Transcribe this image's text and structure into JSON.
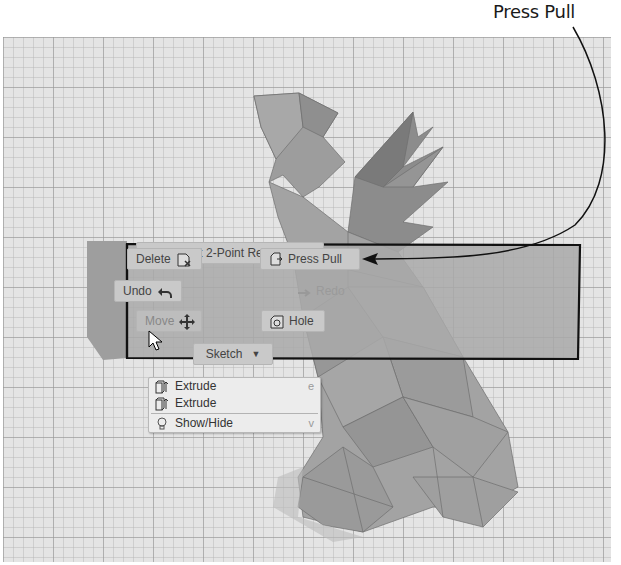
{
  "annotation": {
    "label": "Press Pull"
  },
  "marking_menu": {
    "repeat_command": "Repeat 2-Point Rectangle",
    "delete": "Delete",
    "press_pull": "Press Pull",
    "undo": "Undo",
    "redo": "Redo",
    "move": "Move",
    "hole": "Hole",
    "sketch": "Sketch"
  },
  "dropdown": {
    "items": [
      {
        "label": "Extrude",
        "shortcut": "e",
        "icon": "extrude-icon"
      },
      {
        "label": "Extrude",
        "shortcut": "",
        "icon": "extrude-icon"
      },
      {
        "label": "Show/Hide",
        "shortcut": "v",
        "icon": "lightbulb-icon"
      }
    ]
  },
  "colors": {
    "viewport_bg": "#e4e4e4",
    "model_fill": "#9a9a9a",
    "highlight_box_fill": "#a8a8a8",
    "outline": "#111111"
  }
}
